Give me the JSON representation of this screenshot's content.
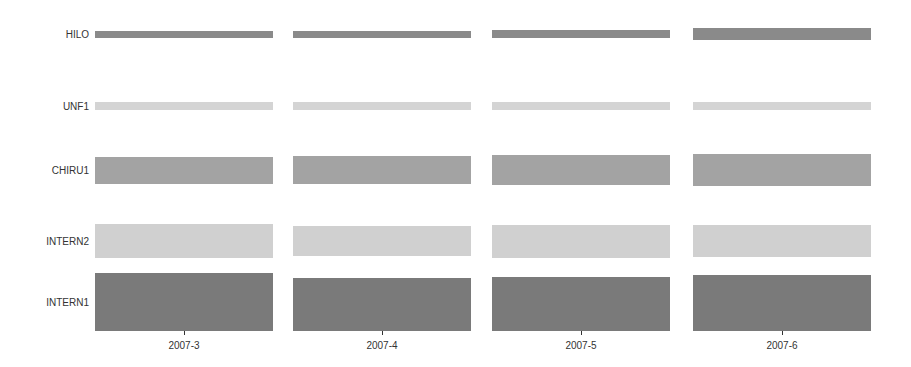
{
  "chart_data": {
    "type": "bar",
    "subtype": "bar-height matrix (rows x columns, bar thickness encodes value)",
    "title": "",
    "xlabel": "",
    "ylabel": "",
    "grid": false,
    "legend": null,
    "categories": [
      "2007-3",
      "2007-4",
      "2007-5",
      "2007-6"
    ],
    "rows": [
      "HILO",
      "UNF1",
      "CHIRU1",
      "INTERN2",
      "INTERN1"
    ],
    "series": [
      {
        "name": "HILO",
        "values": [
          7,
          7,
          8,
          12
        ],
        "color": "#8a8a8a"
      },
      {
        "name": "UNF1",
        "values": [
          8,
          8,
          8,
          8
        ],
        "color": "#d4d4d4"
      },
      {
        "name": "CHIRU1",
        "values": [
          27,
          28,
          30,
          32
        ],
        "color": "#a3a3a3"
      },
      {
        "name": "INTERN2",
        "values": [
          34,
          30,
          33,
          32
        ],
        "color": "#d0d0d0"
      },
      {
        "name": "INTERN1",
        "values": [
          58,
          53,
          54,
          56
        ],
        "color": "#7a7a7a"
      }
    ],
    "units_note": "values are relative bar thicknesses estimated in pixels"
  },
  "layout": {
    "columns_x": [
      95,
      293,
      492,
      693
    ],
    "column_width": 178,
    "row_centers": [
      34,
      106,
      170,
      241,
      302
    ],
    "row_anchor": [
      "center",
      "center",
      "center",
      "center",
      "bottom"
    ],
    "intern1_bottom": 331,
    "tick_y": 331,
    "label_y": 340
  }
}
